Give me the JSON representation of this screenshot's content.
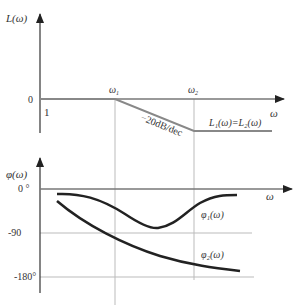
{
  "magnitude_plot": {
    "y_label": "L(ω)",
    "x_label": "ω",
    "zero_tick": "0",
    "one_tick": "1",
    "omega1_label": "ω",
    "omega1_sub": "1",
    "omega2_label": "ω",
    "omega2_sub": "2",
    "slope_label": "−20dB/dec",
    "curve_label": "L₁(ω)=L₂(ω)"
  },
  "phase_plot": {
    "y_label": "φ(ω)",
    "x_label": "ω",
    "ticks": [
      "0 °",
      "-90",
      "-180°"
    ],
    "phi1_label": "φ₁(ω)",
    "phi2_label": "φ₂(ω)"
  },
  "colors": {
    "axis": "#333333",
    "grid": "#bbbbbb",
    "asymptote": "#888888",
    "curve": "#222222"
  }
}
